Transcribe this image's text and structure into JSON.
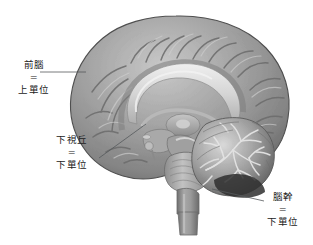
{
  "figure": {
    "kind": "sagittal-brain-diagram",
    "background_color": "#ffffff",
    "width": 313,
    "height": 245,
    "line_color": "#55595c",
    "text_color": "#222222",
    "equals_sign": "="
  },
  "labels": [
    {
      "id": "forebrain",
      "term": "前腦",
      "equals": "=",
      "unit": "上單位",
      "leader": {
        "x1": 40,
        "y1": 72,
        "x2": 86,
        "y2": 72
      }
    },
    {
      "id": "hypothalamus",
      "term": "下視丘",
      "equals": "=",
      "unit": "下單位",
      "leader": {
        "x1": 99,
        "y1": 158,
        "x2": 146,
        "y2": 124
      }
    },
    {
      "id": "brainstem",
      "term": "腦幹",
      "equals": "=",
      "unit": "下單位",
      "leader": {
        "x1": 212,
        "y1": 189,
        "x2": 264,
        "y2": 201
      }
    }
  ],
  "anatomy": {
    "structures": [
      "cerebral cortex",
      "corpus callosum",
      "thalamus",
      "hypothalamus",
      "midbrain",
      "pons",
      "medulla oblongata",
      "cerebellum",
      "spinal cord"
    ],
    "palette": {
      "cortex_light": "#b9b9b9",
      "cortex_mid": "#8f8f8f",
      "cortex_dark": "#6a6a6a",
      "outline": "#4a4a4a",
      "callosum_light": "#e2e2e2",
      "cerebellum_light": "#d8d8d8",
      "cerebellum_dark": "#3c3c3c",
      "brainstem_mid": "#9a9a9a"
    }
  }
}
